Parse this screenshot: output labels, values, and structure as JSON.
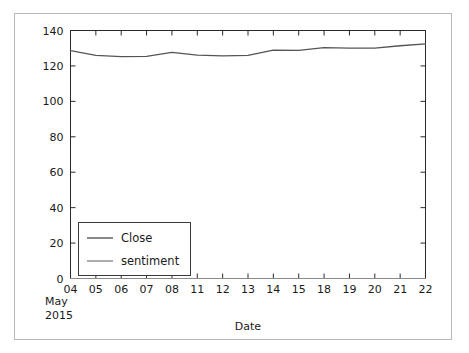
{
  "chart_data": {
    "type": "line",
    "title": "",
    "xlabel": "Date",
    "ylabel": "",
    "x_offset_text": [
      "May",
      "2015"
    ],
    "categories": [
      "04",
      "05",
      "06",
      "07",
      "08",
      "11",
      "12",
      "13",
      "14",
      "15",
      "18",
      "19",
      "20",
      "21",
      "22"
    ],
    "xtick_labels": [
      "04",
      "05",
      "06",
      "07",
      "08",
      "11",
      "12",
      "13",
      "14",
      "15",
      "18",
      "19",
      "20",
      "21",
      "22"
    ],
    "ytick_labels": [
      "0",
      "20",
      "40",
      "60",
      "80",
      "100",
      "120",
      "140"
    ],
    "ytick_values": [
      0,
      20,
      40,
      60,
      80,
      100,
      120,
      140
    ],
    "ylim": [
      0,
      140
    ],
    "grid": false,
    "legend_position": "lower left",
    "series": [
      {
        "name": "Close",
        "color": "#555555",
        "values": [
          128.6,
          126.0,
          125.3,
          125.4,
          127.6,
          126.1,
          125.7,
          126.0,
          128.9,
          128.8,
          130.3,
          130.1,
          130.0,
          131.4,
          132.4
        ]
      },
      {
        "name": "sentiment",
        "color": "#8a8a8a",
        "values": [
          0,
          0,
          0,
          0,
          0,
          0,
          0,
          0,
          0,
          0,
          0,
          0,
          0,
          0,
          0
        ]
      }
    ]
  },
  "legend": {
    "entries": [
      {
        "label": "Close"
      },
      {
        "label": "sentiment"
      }
    ]
  },
  "axes": {
    "xlabel": "Date",
    "offset_line_1": "May",
    "offset_line_2": "2015"
  },
  "colors": {
    "close_line": "#555555",
    "sentiment_line": "#8a8a8a",
    "axis": "#1a1a1a",
    "figure_border": "#b9b9b9",
    "background": "#ffffff"
  }
}
